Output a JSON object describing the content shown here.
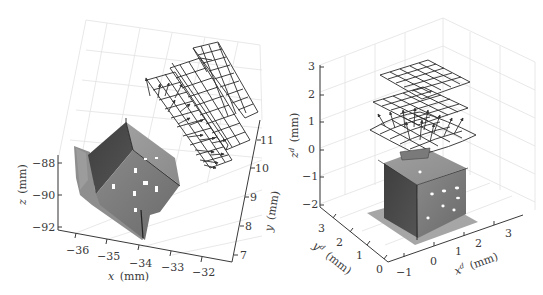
{
  "figure": {
    "left_panel": {
      "type": "3d-surface-with-vector-grids",
      "x_axis": {
        "label_var": "x",
        "label_unit": "(mm)",
        "ticks": [
          "−36",
          "−35",
          "−34",
          "−33",
          "−32"
        ]
      },
      "y_axis": {
        "label_var": "y",
        "label_unit": "(mm)",
        "ticks": [
          "7",
          "8",
          "9",
          "10",
          "11"
        ]
      },
      "z_axis": {
        "label_var": "z",
        "label_unit": "(mm)",
        "ticks": [
          "−88",
          "−90",
          "−92"
        ]
      },
      "content": [
        "cube-surface-scan",
        "three-mesh-grids",
        "displacement-vectors"
      ]
    },
    "right_panel": {
      "type": "3d-surface-with-vector-grids",
      "x_axis": {
        "label_var": "x",
        "label_sup": "d",
        "label_unit": "(mm)",
        "ticks": [
          "−1",
          "0",
          "1",
          "2",
          "3"
        ]
      },
      "y_axis": {
        "label_var": "y",
        "label_sup": "d",
        "label_unit": "(mm)",
        "ticks": [
          "0",
          "1",
          "2",
          "3"
        ]
      },
      "z_axis": {
        "label_var": "z",
        "label_sup": "d",
        "label_unit": "(mm)",
        "ticks": [
          "3",
          "2",
          "1",
          "0",
          "−1",
          "−2"
        ]
      },
      "content": [
        "cube-surface-scan",
        "three-mesh-grids",
        "displacement-vectors"
      ]
    },
    "colors": {
      "axis": "#3a3a3a",
      "grid": "#e2e2e2",
      "mesh": "#2a2a2a",
      "surface_dark": "#4a4a4a",
      "surface_mid": "#7a7a7a",
      "surface_light": "#a8a8a8"
    }
  }
}
